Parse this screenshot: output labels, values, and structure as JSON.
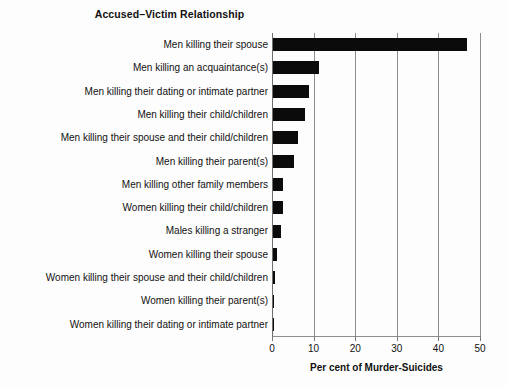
{
  "chart_data": {
    "type": "bar",
    "orientation": "horizontal",
    "title": "Accused–Victim Relationship",
    "xlabel": "Per cent of Murder-Suicides",
    "ylabel": "",
    "xlim": [
      0,
      50
    ],
    "grid": true,
    "legend": false,
    "xticks": [
      "0",
      "10",
      "20",
      "30",
      "40",
      "50"
    ],
    "xtick_values": [
      0,
      10,
      20,
      30,
      40,
      50
    ],
    "categories": [
      "Men killing their spouse",
      "Men killing an acquaintance(s)",
      "Men killing their dating or intimate partner",
      "Men killing their child/children",
      "Men killing their spouse and their child/children",
      "Men killing their parent(s)",
      "Men killing other family members",
      "Women killing their child/children",
      "Males killing a stranger",
      "Women killing their spouse",
      "Women killing their spouse and their child/children",
      "Women killing their parent(s)",
      "Women killing their dating or intimate partner"
    ],
    "values": [
      46.6,
      11.1,
      8.7,
      7.7,
      6.0,
      5.0,
      2.4,
      2.4,
      1.9,
      1.0,
      0.6,
      0.3,
      0.2
    ],
    "series": [
      {
        "name": "Per cent of Murder-Suicides",
        "values": [
          46.6,
          11.1,
          8.7,
          7.7,
          6.0,
          5.0,
          2.4,
          2.4,
          1.9,
          1.0,
          0.6,
          0.3,
          0.2
        ]
      }
    ],
    "bar_color": "#0b0b0b",
    "background_color": "#fdfdfd",
    "gridline_color": "#8d8d8d",
    "axis_color": "#6f6f6f"
  }
}
